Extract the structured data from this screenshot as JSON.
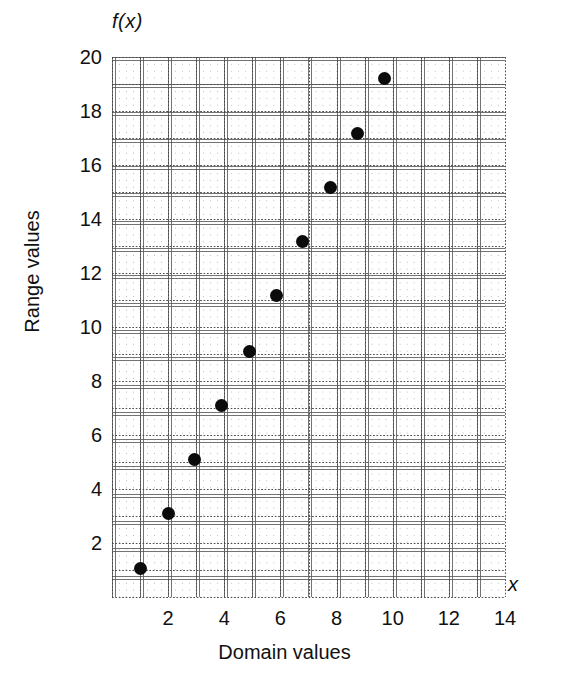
{
  "chart_data": {
    "type": "scatter",
    "title": "",
    "xlabel": "Domain values",
    "ylabel": "Range values",
    "x_axis_symbol": "x",
    "y_axis_symbol": "f(x)",
    "xlim": [
      0,
      14
    ],
    "ylim": [
      0,
      20
    ],
    "grid": true,
    "grid_style": "dotted",
    "legend": "none",
    "x_ticks": [
      2,
      4,
      6,
      8,
      10,
      12,
      14
    ],
    "y_ticks": [
      2,
      4,
      6,
      8,
      10,
      12,
      14,
      16,
      18,
      20
    ],
    "x_tick_labels": [
      "2",
      "4",
      "6",
      "8",
      "10",
      "12",
      "14"
    ],
    "y_tick_labels": [
      "2",
      "4",
      "6",
      "8",
      "10",
      "12",
      "14",
      "16",
      "18",
      "20"
    ],
    "marker": "filled-circle",
    "marker_color": "#0b0b0b",
    "marker_size": 13,
    "x": [
      1.0,
      2.0,
      2.95,
      3.9,
      4.9,
      5.85,
      6.8,
      7.8,
      8.75,
      9.7
    ],
    "y": [
      1.05,
      3.1,
      5.1,
      7.1,
      9.1,
      11.15,
      13.15,
      15.15,
      17.15,
      19.2
    ],
    "points": [
      {
        "x": 1.0,
        "y": 1.05
      },
      {
        "x": 2.0,
        "y": 3.1
      },
      {
        "x": 2.95,
        "y": 5.1
      },
      {
        "x": 3.9,
        "y": 7.1
      },
      {
        "x": 4.9,
        "y": 9.1
      },
      {
        "x": 5.85,
        "y": 11.15
      },
      {
        "x": 6.8,
        "y": 13.15
      },
      {
        "x": 7.8,
        "y": 15.15
      },
      {
        "x": 8.75,
        "y": 17.15
      },
      {
        "x": 9.7,
        "y": 19.2
      }
    ]
  },
  "colors": {
    "background": "#ffffff",
    "text": "#111111",
    "grid": "#8c8c8c",
    "marker": "#0b0b0b"
  }
}
